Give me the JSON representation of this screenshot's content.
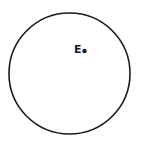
{
  "diagram": {
    "shape": "circle",
    "circle": {
      "cx": 69.5,
      "cy": 73.5,
      "r": 60.5,
      "stroke": "#1a1a1a",
      "stroke_width": 1.6
    },
    "point": {
      "label": "E",
      "cx": 84.5,
      "cy": 51,
      "r": 2.2,
      "color": "#1a1a1a"
    }
  }
}
